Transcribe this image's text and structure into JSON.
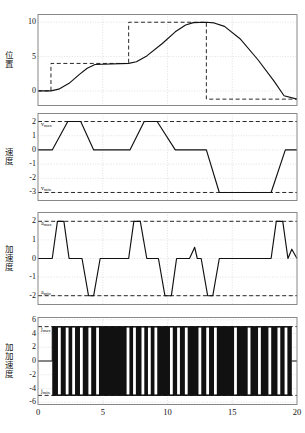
{
  "figure": {
    "background": "#ffffff",
    "line_color": "#111111",
    "dash_color": "#111111",
    "grid_color": "#cccccc",
    "frame_color": "#888888",
    "xlabel": "",
    "x_ticks": [
      "0",
      "5",
      "10",
      "15",
      "20"
    ],
    "xlim": [
      0,
      20
    ]
  },
  "panels": [
    {
      "id": "position",
      "ylabel": "位置",
      "y_ticks": [
        "10",
        "5",
        "0"
      ],
      "y_tick_values": [
        10,
        5,
        0
      ],
      "ylim": [
        -2.2,
        11.2
      ],
      "annotations": []
    },
    {
      "id": "velocity",
      "ylabel": "速度",
      "y_ticks": [
        "2",
        "1",
        "0",
        "-1",
        "-2",
        "-3"
      ],
      "y_tick_values": [
        2,
        1,
        0,
        -1,
        -2,
        -3
      ],
      "ylim": [
        -3.6,
        2.6
      ],
      "annotations": [
        {
          "name": "v-max-label",
          "text": "v",
          "sub": "max",
          "value": 2
        },
        {
          "name": "v-min-label",
          "text": "v",
          "sub": "min",
          "value": -3
        }
      ]
    },
    {
      "id": "acceleration",
      "ylabel": "加速度",
      "y_ticks": [
        "2",
        "1",
        "0",
        "-1",
        "-2"
      ],
      "y_tick_values": [
        2,
        1,
        0,
        -1,
        -2
      ],
      "ylim": [
        -2.5,
        2.5
      ],
      "annotations": [
        {
          "name": "a-max-label",
          "text": "a",
          "sub": "max",
          "value": 2
        },
        {
          "name": "a-min-label",
          "text": "a",
          "sub": "min",
          "value": -2
        }
      ]
    },
    {
      "id": "jerk",
      "ylabel": "加加速度",
      "y_ticks": [
        "6",
        "4",
        "2",
        "0",
        "-2",
        "-4",
        "-6"
      ],
      "y_tick_values": [
        6,
        4,
        2,
        0,
        -2,
        -4,
        -6
      ],
      "ylim": [
        -6.4,
        6.4
      ],
      "annotations": [
        {
          "name": "j-max-label",
          "text": "j",
          "sub": "max",
          "value": 5
        },
        {
          "name": "j-min-label",
          "text": "j",
          "sub": "min",
          "value": -5
        }
      ]
    }
  ],
  "chart_data": [
    {
      "type": "line",
      "title": "",
      "xlabel": "",
      "ylabel": "位置",
      "xlim": [
        0,
        20
      ],
      "ylim": [
        -2.2,
        11.2
      ],
      "grid": true,
      "series": [
        {
          "name": "reference-step",
          "style": "dashed",
          "x": [
            0,
            1,
            1,
            7,
            7,
            13,
            13,
            20
          ],
          "values": [
            0,
            0,
            4,
            4,
            10,
            10,
            -1.2,
            -1.2
          ]
        },
        {
          "name": "position-response",
          "style": "solid",
          "x": [
            0,
            1,
            1.6,
            2.4,
            3.2,
            3.8,
            4.4,
            7,
            7.6,
            8.4,
            9.6,
            10.6,
            11.4,
            12,
            13,
            13.6,
            14.4,
            15.6,
            17,
            18.2,
            19,
            20
          ],
          "values": [
            0,
            0,
            0.25,
            1.1,
            2.4,
            3.3,
            3.85,
            4,
            4.25,
            5.1,
            6.9,
            8.6,
            9.6,
            9.95,
            10,
            9.9,
            9.4,
            7.6,
            4.5,
            1.5,
            -0.7,
            -1.2
          ]
        }
      ]
    },
    {
      "type": "line",
      "title": "",
      "xlabel": "",
      "ylabel": "速度",
      "xlim": [
        0,
        20
      ],
      "ylim": [
        -3.6,
        2.6
      ],
      "grid": true,
      "series": [
        {
          "name": "v-max-limit",
          "style": "dashed",
          "x": [
            0,
            20
          ],
          "values": [
            2,
            2
          ]
        },
        {
          "name": "v-min-limit",
          "style": "dashed",
          "x": [
            0,
            20
          ],
          "values": [
            -3,
            -3
          ]
        },
        {
          "name": "velocity-profile",
          "style": "solid",
          "x": [
            0,
            1.1,
            2.3,
            3.3,
            4.3,
            5.4,
            7.1,
            8.2,
            9.2,
            10.6,
            11.6,
            12.6,
            13.0,
            14.0,
            15.2,
            16.2,
            18.0,
            19.1,
            20
          ],
          "values": [
            0,
            0,
            2,
            2,
            0,
            0,
            0,
            2,
            2,
            0,
            0,
            0,
            0,
            -3,
            -3,
            -3,
            -3,
            0,
            0
          ]
        }
      ]
    },
    {
      "type": "line",
      "title": "",
      "xlabel": "",
      "ylabel": "加速度",
      "xlim": [
        0,
        20
      ],
      "ylim": [
        -2.5,
        2.5
      ],
      "grid": true,
      "series": [
        {
          "name": "a-max-limit",
          "style": "dashed",
          "x": [
            0,
            20
          ],
          "values": [
            2,
            2
          ]
        },
        {
          "name": "a-min-limit",
          "style": "dashed",
          "x": [
            0,
            20
          ],
          "values": [
            -2,
            -2
          ]
        },
        {
          "name": "acceleration-profile",
          "style": "solid",
          "x": [
            0,
            1.1,
            1.5,
            2.0,
            2.4,
            2.9,
            3.4,
            3.9,
            4.3,
            4.8,
            5.3,
            7.0,
            7.4,
            7.9,
            8.4,
            8.9,
            9.3,
            9.8,
            10.3,
            10.7,
            11.2,
            11.7,
            12.1,
            12.3,
            12.6,
            13.1,
            13.5,
            14.0,
            15.3,
            18.0,
            18.4,
            18.9,
            19.3,
            19.6,
            20
          ],
          "values": [
            0,
            0,
            2,
            2,
            0,
            0,
            0,
            -2,
            -2,
            0,
            0,
            0,
            2,
            2,
            0,
            0,
            0,
            -2,
            -2,
            0,
            0,
            0,
            0.6,
            0,
            0,
            -2,
            -2,
            0,
            0,
            0,
            2,
            2,
            0,
            0.5,
            0
          ]
        }
      ]
    },
    {
      "type": "line",
      "title": "",
      "xlabel": "",
      "ylabel": "加加速度",
      "xlim": [
        0,
        20
      ],
      "ylim": [
        -6.4,
        6.4
      ],
      "grid": true,
      "note": "high-frequency bang-bang jerk, saturating at +5 and -5",
      "series": [
        {
          "name": "j-max-limit",
          "style": "dashed",
          "x": [
            0,
            20
          ],
          "values": [
            5,
            5
          ]
        },
        {
          "name": "j-min-limit",
          "style": "dashed",
          "x": [
            0,
            20
          ],
          "values": [
            -5,
            -5
          ]
        },
        {
          "name": "jerk-profile",
          "style": "solid-dense",
          "amplitude": 5,
          "start_x": 1.1,
          "end_x": 19.6,
          "gap_positions": [
            1.65,
            2.25,
            2.75,
            3.35,
            4.0,
            4.6,
            6.95,
            7.45,
            8.1,
            8.6,
            9.1,
            10.3,
            10.85,
            11.45,
            12.5,
            13.1,
            13.7,
            15.25,
            16.3,
            17.1,
            17.9,
            18.6,
            19.15
          ]
        }
      ]
    }
  ],
  "caption": {
    "text": ""
  }
}
